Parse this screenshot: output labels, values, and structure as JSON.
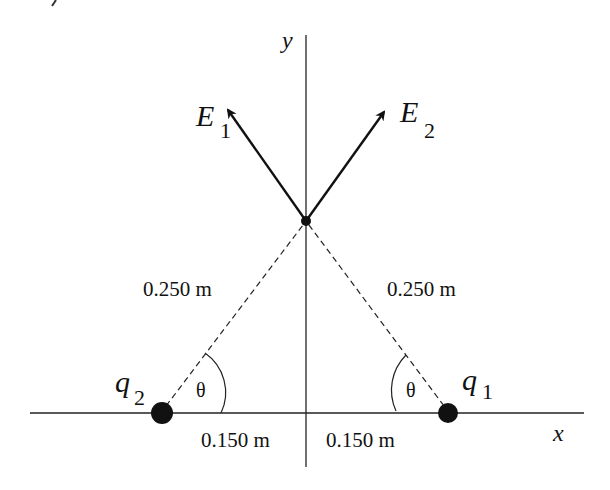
{
  "diagram": {
    "axes": {
      "x_label": "x",
      "y_label": "y"
    },
    "point": {
      "x": 306,
      "y": 221
    },
    "vectors": [
      {
        "id": "E1",
        "symbol": "E",
        "subscript": "1"
      },
      {
        "id": "E2",
        "symbol": "E",
        "subscript": "2"
      }
    ],
    "charges": [
      {
        "id": "q1",
        "symbol": "q",
        "subscript": "1"
      },
      {
        "id": "q2",
        "symbol": "q",
        "subscript": "2"
      }
    ],
    "distances": {
      "left_hypotenuse": "0.250 m",
      "right_hypotenuse": "0.250 m",
      "left_base": "0.150 m",
      "right_base": "0.150 m"
    },
    "angles": {
      "left": "θ",
      "right": "θ"
    },
    "colors": {
      "ink": "#111111",
      "background": "#ffffff"
    }
  }
}
